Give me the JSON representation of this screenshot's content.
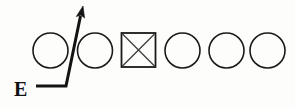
{
  "figure": {
    "background_color": "#fdfdfc",
    "ink_color": "#1a1a1a",
    "width": 295,
    "height": 109
  },
  "label": {
    "text": "E",
    "x": 14,
    "y": 96
  },
  "pointer": {
    "name": "elbow-arrow",
    "polyline": "36,86 66,86 82,9",
    "arrow_tip_x": 83,
    "arrow_tip_y": 7,
    "stroke_color": "#141414",
    "stroke_width": 3
  },
  "nodes": [
    {
      "index": 1,
      "shape": "circle",
      "cx": 50.5,
      "cy": 50.5,
      "r": 17.5,
      "marked": false
    },
    {
      "index": 2,
      "shape": "circle",
      "cx": 95.0,
      "cy": 50.5,
      "r": 17.5,
      "marked": false
    },
    {
      "index": 3,
      "shape": "square",
      "x": 121.5,
      "y": 33.0,
      "size": 34.0,
      "marked": true
    },
    {
      "index": 4,
      "shape": "circle",
      "cx": 182.5,
      "cy": 50.5,
      "r": 17.5,
      "marked": false
    },
    {
      "index": 5,
      "shape": "circle",
      "cx": 226.5,
      "cy": 50.5,
      "r": 17.5,
      "marked": false
    },
    {
      "index": 6,
      "shape": "circle",
      "cx": 267.5,
      "cy": 50.5,
      "r": 17.5,
      "marked": false
    }
  ],
  "node_names": [
    "node-circle-1",
    "node-circle-2",
    "node-square-crossed-3",
    "node-circle-4",
    "node-circle-5",
    "node-circle-6"
  ]
}
